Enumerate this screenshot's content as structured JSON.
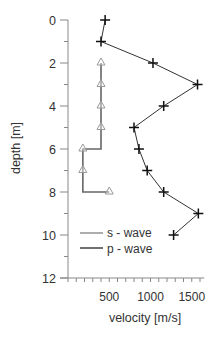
{
  "chart_data": {
    "type": "line",
    "title": "",
    "xlabel": "velocity [m/s]",
    "ylabel": "depth [m]",
    "xlim": [
      0,
      1650
    ],
    "ylim": [
      12,
      0
    ],
    "y_inverted": true,
    "grid": false,
    "legend_position": "lower-left inside",
    "x_ticks": [
      500,
      1000,
      1500
    ],
    "x_tick_labels": [
      "500",
      "1000",
      "1500"
    ],
    "x_minor_step": 200,
    "y_ticks": [
      0,
      2,
      4,
      6,
      8,
      10,
      12
    ],
    "y_tick_labels": [
      "0",
      "2",
      "4",
      "6",
      "8",
      "10",
      "12"
    ],
    "y_minor_step": 1,
    "series": [
      {
        "name": "s - wave",
        "marker": "triangle",
        "line_style": "step",
        "color": "#666666",
        "marker_color": "#999999",
        "points": [
          {
            "depth": 2,
            "velocity": 400
          },
          {
            "depth": 3,
            "velocity": 400
          },
          {
            "depth": 4,
            "velocity": 400
          },
          {
            "depth": 5,
            "velocity": 400
          },
          {
            "depth": 6,
            "velocity": 180
          },
          {
            "depth": 7,
            "velocity": 180
          },
          {
            "depth": 8,
            "velocity": 500
          }
        ]
      },
      {
        "name": "p - wave",
        "marker": "plus",
        "line_style": "straight",
        "color": "#333333",
        "marker_color": "#111111",
        "points": [
          {
            "depth": 0,
            "velocity": 450
          },
          {
            "depth": 1,
            "velocity": 400
          },
          {
            "depth": 2,
            "velocity": 1030
          },
          {
            "depth": 3,
            "velocity": 1570
          },
          {
            "depth": 4,
            "velocity": 1160
          },
          {
            "depth": 5,
            "velocity": 800
          },
          {
            "depth": 6,
            "velocity": 860
          },
          {
            "depth": 7,
            "velocity": 960
          },
          {
            "depth": 8,
            "velocity": 1160
          },
          {
            "depth": 9,
            "velocity": 1580
          },
          {
            "depth": 10,
            "velocity": 1280
          }
        ]
      }
    ]
  },
  "legend": {
    "s_label": "s - wave",
    "p_label": "p - wave"
  },
  "axes": {
    "xlabel": "velocity [m/s]",
    "ylabel": "depth [m]"
  }
}
